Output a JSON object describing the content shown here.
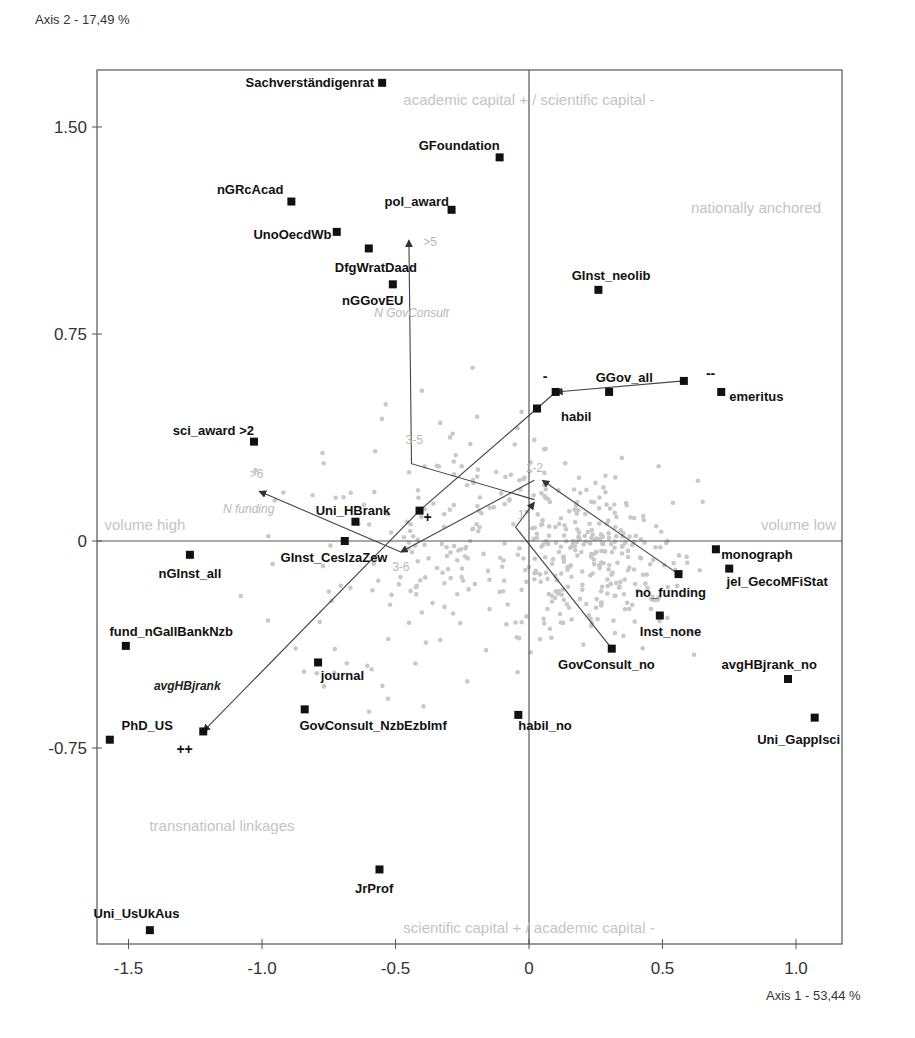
{
  "chart_data": {
    "type": "scatter",
    "title": "",
    "xlabel": "Axis 1 - 53,44 %",
    "ylabel": "Axis 2 - 17,49 %",
    "xlim": [
      -1.61,
      1.17
    ],
    "ylim": [
      -1.46,
      1.71
    ],
    "x_ticks": [
      -1.5,
      -1.0,
      -0.5,
      0,
      0.5,
      1.0
    ],
    "x_tick_labels": [
      "-1.5",
      "-1.0",
      "-0.5",
      "0",
      "0.5",
      "1.0"
    ],
    "y_ticks": [
      1.5,
      0.75,
      0,
      -0.75
    ],
    "y_tick_labels": [
      "1.50",
      "0.75",
      "0",
      "-0.75"
    ],
    "grid": false,
    "origin_lines": true,
    "colors": {
      "category": "#111111",
      "individual": "#c8c8c8",
      "region_text": "#c4c4c4",
      "trajectory": "#444444",
      "frame": "#555555"
    },
    "region_labels": [
      {
        "text": "academic capital + / scientific capital -",
        "x": 0.0,
        "y": 1.58,
        "anchor": "middle"
      },
      {
        "text": "nationally anchored",
        "x": 0.85,
        "y": 1.19,
        "anchor": "middle"
      },
      {
        "text": "volume high",
        "x": -1.59,
        "y": 0.04,
        "anchor": "start"
      },
      {
        "text": "volume low",
        "x": 1.15,
        "y": 0.04,
        "anchor": "end"
      },
      {
        "text": "transnational linkages",
        "x": -1.15,
        "y": -1.05,
        "anchor": "middle"
      },
      {
        "text": "scientific capital + / academic capital -",
        "x": 0.0,
        "y": -1.42,
        "anchor": "middle"
      }
    ],
    "categories": [
      {
        "label": "Sachverständigenrat",
        "x": -0.55,
        "y": 1.66,
        "lx": -0.58,
        "ly": 1.66,
        "anchor": "end"
      },
      {
        "label": "GFoundation",
        "x": -0.11,
        "y": 1.39,
        "lx": -0.11,
        "ly": 1.43,
        "anchor": "end"
      },
      {
        "label": "nGRcAcad",
        "x": -0.89,
        "y": 1.23,
        "lx": -0.92,
        "ly": 1.27,
        "anchor": "end"
      },
      {
        "label": "pol_award",
        "x": -0.29,
        "y": 1.2,
        "lx": -0.3,
        "ly": 1.23,
        "anchor": "end"
      },
      {
        "label": "UnoOecdWb",
        "x": -0.72,
        "y": 1.12,
        "lx": -0.74,
        "ly": 1.11,
        "anchor": "end"
      },
      {
        "label": "DfgWratDaad",
        "x": -0.6,
        "y": 1.06,
        "lx": -0.42,
        "ly": 0.99,
        "anchor": "end"
      },
      {
        "label": "nGGovEU",
        "x": -0.51,
        "y": 0.93,
        "lx": -0.47,
        "ly": 0.87,
        "anchor": "end"
      },
      {
        "label": "GInst_neolib",
        "x": 0.26,
        "y": 0.91,
        "lx": 0.16,
        "ly": 0.96,
        "anchor": "start"
      },
      {
        "label": "GGov_all",
        "x": 0.3,
        "y": 0.54,
        "lx": 0.25,
        "ly": 0.59,
        "anchor": "start"
      },
      {
        "label": "emeritus",
        "x": 0.72,
        "y": 0.54,
        "lx": 0.75,
        "ly": 0.52,
        "anchor": "start"
      },
      {
        "label": "habil",
        "x": 0.03,
        "y": 0.48,
        "lx": 0.12,
        "ly": 0.45,
        "anchor": "start"
      },
      {
        "label": "sci_award >2",
        "x": -1.03,
        "y": 0.36,
        "lx": -1.03,
        "ly": 0.4,
        "anchor": "end"
      },
      {
        "label": "Uni_HBrank",
        "x": -0.65,
        "y": 0.07,
        "lx": -0.52,
        "ly": 0.11,
        "anchor": "end"
      },
      {
        "label": "GInst_CesIzaZew",
        "x": -0.69,
        "y": 0.0,
        "lx": -0.53,
        "ly": -0.06,
        "anchor": "end"
      },
      {
        "label": "nGInst_all",
        "x": -1.27,
        "y": -0.05,
        "lx": -1.27,
        "ly": -0.12,
        "anchor": "middle"
      },
      {
        "label": "monograph",
        "x": 0.7,
        "y": -0.03,
        "lx": 0.72,
        "ly": -0.05,
        "anchor": "start"
      },
      {
        "label": "jel_GecoMFiStat",
        "x": 0.75,
        "y": -0.1,
        "lx": 0.74,
        "ly": -0.15,
        "anchor": "start"
      },
      {
        "label": "no_funding",
        "x": 0.56,
        "y": -0.12,
        "lx": 0.53,
        "ly": -0.19,
        "anchor": "middle"
      },
      {
        "label": "Inst_none",
        "x": 0.49,
        "y": -0.27,
        "lx": 0.53,
        "ly": -0.33,
        "anchor": "middle"
      },
      {
        "label": "fund_nGallBankNzb",
        "x": -1.51,
        "y": -0.38,
        "lx": -1.34,
        "ly": -0.33,
        "anchor": "middle"
      },
      {
        "label": "GovConsult_no",
        "x": 0.31,
        "y": -0.39,
        "lx": 0.29,
        "ly": -0.45,
        "anchor": "middle"
      },
      {
        "label": "journal",
        "x": -0.79,
        "y": -0.44,
        "lx": -0.78,
        "ly": -0.49,
        "anchor": "start"
      },
      {
        "label": "avgHBjrank_no",
        "x": 0.97,
        "y": -0.5,
        "lx": 0.9,
        "ly": -0.45,
        "anchor": "middle"
      },
      {
        "label": "GovConsult_NzbEzbImf",
        "x": -0.84,
        "y": -0.61,
        "lx": -0.86,
        "ly": -0.67,
        "anchor": "start"
      },
      {
        "label": "habil_no",
        "x": -0.04,
        "y": -0.63,
        "lx": -0.04,
        "ly": -0.67,
        "anchor": "start"
      },
      {
        "label": "Uni_GappIsci",
        "x": 1.07,
        "y": -0.64,
        "lx": 1.01,
        "ly": -0.72,
        "anchor": "middle"
      },
      {
        "label": "PhD_US",
        "x": -1.57,
        "y": -0.72,
        "lx": -1.43,
        "ly": -0.67,
        "anchor": "middle"
      },
      {
        "label": "JrProf",
        "x": -0.56,
        "y": -1.19,
        "lx": -0.58,
        "ly": -1.26,
        "anchor": "middle"
      },
      {
        "label": "Uni_UsUkAus",
        "x": -1.42,
        "y": -1.41,
        "lx": -1.47,
        "ly": -1.35,
        "anchor": "middle"
      },
      {
        "label": "",
        "x": 0.1,
        "y": 0.54,
        "lx": 0,
        "ly": 0,
        "anchor": "start"
      },
      {
        "label": "",
        "x": 0.58,
        "y": 0.58,
        "lx": 0,
        "ly": 0,
        "anchor": "start"
      },
      {
        "label": "",
        "x": -0.41,
        "y": 0.11,
        "lx": 0,
        "ly": 0,
        "anchor": "start"
      },
      {
        "label": "",
        "x": -1.22,
        "y": -0.69,
        "lx": 0,
        "ly": 0,
        "anchor": "start"
      }
    ],
    "trajectories": [
      {
        "name": "N_GovConsult",
        "points": [
          [
            0.31,
            -0.39
          ],
          [
            -0.05,
            0.05
          ],
          [
            0.02,
            0.14
          ]
        ],
        "end_labels": [
          {
            "text": "1",
            "x": -0.03,
            "y": 0.08
          }
        ]
      },
      {
        "name": "N_GovConsult_b",
        "points": [
          [
            0.56,
            -0.12
          ],
          [
            0.05,
            0.22
          ]
        ],
        "end_labels": [
          {
            "text": "1-2",
            "x": 0.02,
            "y": 0.25
          }
        ]
      },
      {
        "name": "N_GovConsult_c",
        "points": [
          [
            0.02,
            0.15
          ],
          [
            -0.44,
            0.28
          ],
          [
            -0.45,
            1.09
          ]
        ],
        "end_labels": [
          {
            "text": "3-5",
            "x": -0.43,
            "y": 0.35
          },
          {
            "text": ">5",
            "x": -0.37,
            "y": 1.07
          }
        ]
      },
      {
        "name": "N_funding",
        "points": [
          [
            0.02,
            0.22
          ],
          [
            -0.48,
            -0.04
          ]
        ],
        "end_labels": [
          {
            "text": "3-6",
            "x": -0.48,
            "y": -0.11
          }
        ]
      },
      {
        "name": "N_funding_b",
        "points": [
          [
            -0.48,
            -0.04
          ],
          [
            -1.01,
            0.18
          ]
        ],
        "end_labels": [
          {
            "text": ">6",
            "x": -1.02,
            "y": 0.23
          }
        ]
      },
      {
        "name": "GGov_trend",
        "points": [
          [
            0.58,
            0.58
          ],
          [
            0.1,
            0.54
          ]
        ],
        "end_labels": []
      },
      {
        "name": "avgHBjrank",
        "points": [
          [
            0.1,
            0.54
          ],
          [
            0.03,
            0.48
          ],
          [
            -0.41,
            0.11
          ],
          [
            -1.22,
            -0.69
          ]
        ],
        "end_labels": []
      }
    ],
    "trajectory_names": [
      {
        "text": "N GovConsult",
        "x": -0.44,
        "y": 0.81,
        "style": "light"
      },
      {
        "text": "N funding",
        "x": -1.05,
        "y": 0.1,
        "style": "light"
      },
      {
        "text": "avgHBjrank",
        "x": -1.28,
        "y": -0.54,
        "style": "dark"
      }
    ],
    "markers": [
      {
        "text": "-",
        "x": 0.06,
        "y": 0.58
      },
      {
        "text": "--",
        "x": 0.68,
        "y": 0.59
      },
      {
        "text": "+",
        "x": -0.38,
        "y": 0.07
      },
      {
        "text": "++",
        "x": -1.29,
        "y": -0.77
      }
    ],
    "individuals_seed": 20240,
    "individuals_count": 470
  }
}
